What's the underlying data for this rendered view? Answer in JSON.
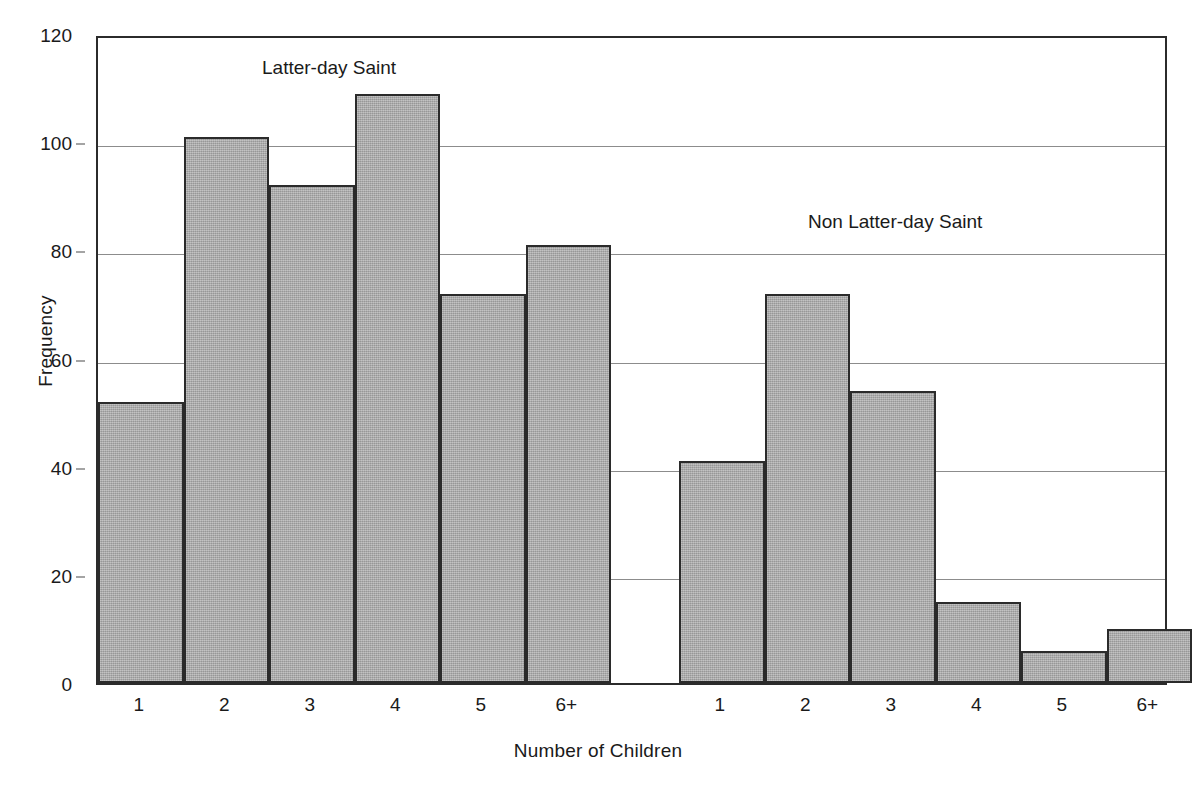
{
  "chart_data": {
    "type": "bar",
    "title": "",
    "xlabel": "Number of Children",
    "ylabel": "Frequency",
    "ylim": [
      0,
      120
    ],
    "yticks": [
      0,
      20,
      40,
      60,
      80,
      100,
      120
    ],
    "ytick_labels": [
      "0",
      "20",
      "40",
      "60",
      "80",
      "100",
      "120"
    ],
    "grid": true,
    "legend_position": "none",
    "categories": [
      "1",
      "2",
      "3",
      "4",
      "5",
      "6+"
    ],
    "groups": [
      {
        "name": "Latter-day Saint",
        "annotation": "Latter-day Saint",
        "categories": [
          "1",
          "2",
          "3",
          "4",
          "5",
          "6+"
        ],
        "values": [
          52,
          101,
          92,
          109,
          72,
          81
        ]
      },
      {
        "name": "Non Latter-day Saint",
        "annotation": "Non Latter-day Saint",
        "categories": [
          "1",
          "2",
          "3",
          "4",
          "5",
          "6+"
        ],
        "values": [
          41,
          72,
          54,
          15,
          6,
          10
        ]
      }
    ],
    "bar_fill_color": "#a9a9a9",
    "bar_edge_color": "#2b2b2b",
    "gridline_color": "#8c8c8c",
    "axis_color": "#2b2b2b",
    "background_color": "#ffffff"
  },
  "axes": {
    "y_title": "Frequency",
    "x_title": "Number of Children"
  }
}
